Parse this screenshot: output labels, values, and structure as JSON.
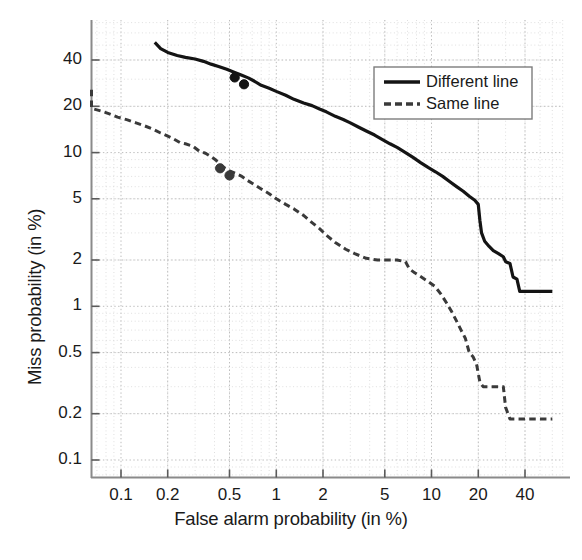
{
  "chart_data": {
    "type": "line",
    "title": "",
    "xlabel": "False alarm probability (in %)",
    "ylabel": "Miss probability (in %)",
    "xscale": "log-normal-deviate",
    "yscale": "log-normal-deviate",
    "grid": true,
    "xticks": [
      0.1,
      0.2,
      0.5,
      1,
      2,
      5,
      10,
      20,
      40
    ],
    "xticklabels": [
      "0.1",
      "0.2",
      "0.5",
      "1",
      "2",
      "5",
      "10",
      "20",
      "40"
    ],
    "yticks": [
      0.1,
      0.2,
      0.5,
      1,
      2,
      5,
      10,
      20,
      40
    ],
    "yticklabels": [
      "0.1",
      "0.2",
      "0.5",
      "1",
      "2",
      "5",
      "10",
      "20",
      "40"
    ],
    "xlim": [
      0.055,
      62
    ],
    "ylim": [
      0.075,
      52
    ],
    "legend_position": "top-right",
    "series": [
      {
        "name": "Different line",
        "style": "solid",
        "color": "#141414",
        "linewidth": 3.2,
        "points": [
          [
            0.165,
            52.0
          ],
          [
            0.18,
            47.5
          ],
          [
            0.2,
            44.8
          ],
          [
            0.23,
            42.8
          ],
          [
            0.26,
            41.6
          ],
          [
            0.3,
            40.6
          ],
          [
            0.34,
            39.2
          ],
          [
            0.38,
            37.6
          ],
          [
            0.43,
            36.2
          ],
          [
            0.48,
            34.8
          ],
          [
            0.53,
            33.4
          ],
          [
            0.6,
            31.8
          ],
          [
            0.66,
            30.6
          ],
          [
            0.72,
            29.2
          ],
          [
            0.8,
            27.4
          ],
          [
            0.9,
            26.2
          ],
          [
            1.0,
            25.0
          ],
          [
            1.15,
            23.6
          ],
          [
            1.3,
            22.2
          ],
          [
            1.5,
            21.0
          ],
          [
            1.7,
            20.2
          ],
          [
            1.9,
            19.2
          ],
          [
            2.1,
            18.4
          ],
          [
            2.4,
            17.2
          ],
          [
            2.7,
            16.4
          ],
          [
            3.0,
            15.6
          ],
          [
            3.4,
            14.6
          ],
          [
            3.8,
            13.8
          ],
          [
            4.3,
            13.0
          ],
          [
            4.8,
            12.2
          ],
          [
            5.4,
            11.4
          ],
          [
            6.0,
            10.8
          ],
          [
            6.8,
            10.0
          ],
          [
            7.6,
            9.3
          ],
          [
            8.5,
            8.6
          ],
          [
            9.5,
            8.0
          ],
          [
            10.6,
            7.5
          ],
          [
            11.8,
            7.0
          ],
          [
            13.0,
            6.5
          ],
          [
            14.5,
            6.0
          ],
          [
            16.0,
            5.6
          ],
          [
            17.5,
            5.2
          ],
          [
            19.0,
            4.9
          ],
          [
            20.0,
            4.6
          ],
          [
            20.5,
            3.6
          ],
          [
            21.0,
            3.0
          ],
          [
            22.0,
            2.65
          ],
          [
            23.5,
            2.45
          ],
          [
            25.0,
            2.3
          ],
          [
            27.0,
            2.2
          ],
          [
            29.0,
            2.1
          ],
          [
            30.0,
            1.95
          ],
          [
            32.0,
            1.9
          ],
          [
            33.5,
            1.55
          ],
          [
            35.5,
            1.5
          ],
          [
            37.0,
            1.25
          ],
          [
            42.0,
            1.25
          ],
          [
            48.0,
            1.25
          ],
          [
            56.0,
            1.25
          ],
          [
            60.0,
            1.25
          ]
        ],
        "markers": [
          [
            0.54,
            30.8
          ],
          [
            0.62,
            27.8
          ]
        ]
      },
      {
        "name": "Same line",
        "style": "dashed",
        "color": "#3a3a3a",
        "linewidth": 3.0,
        "points": [
          [
            0.062,
            25.6
          ],
          [
            0.062,
            22.0
          ],
          [
            0.064,
            19.4
          ],
          [
            0.075,
            18.6
          ],
          [
            0.085,
            17.8
          ],
          [
            0.095,
            17.0
          ],
          [
            0.11,
            16.3
          ],
          [
            0.125,
            15.6
          ],
          [
            0.14,
            15.0
          ],
          [
            0.16,
            14.2
          ],
          [
            0.18,
            13.4
          ],
          [
            0.2,
            12.8
          ],
          [
            0.22,
            12.2
          ],
          [
            0.24,
            11.6
          ],
          [
            0.26,
            11.4
          ],
          [
            0.29,
            11.0
          ],
          [
            0.32,
            10.2
          ],
          [
            0.35,
            9.9
          ],
          [
            0.38,
            9.4
          ],
          [
            0.41,
            8.9
          ],
          [
            0.44,
            8.2
          ],
          [
            0.47,
            7.9
          ],
          [
            0.5,
            7.6
          ],
          [
            0.55,
            7.3
          ],
          [
            0.6,
            7.0
          ],
          [
            0.65,
            6.6
          ],
          [
            0.72,
            6.2
          ],
          [
            0.8,
            5.8
          ],
          [
            0.9,
            5.4
          ],
          [
            1.0,
            5.0
          ],
          [
            1.15,
            4.6
          ],
          [
            1.3,
            4.3
          ],
          [
            1.5,
            3.9
          ],
          [
            1.7,
            3.5
          ],
          [
            1.9,
            3.2
          ],
          [
            2.1,
            2.9
          ],
          [
            2.4,
            2.6
          ],
          [
            2.8,
            2.35
          ],
          [
            3.2,
            2.2
          ],
          [
            3.8,
            2.05
          ],
          [
            4.5,
            2.0
          ],
          [
            5.2,
            2.0
          ],
          [
            6.0,
            2.0
          ],
          [
            6.8,
            1.95
          ],
          [
            7.2,
            1.75
          ],
          [
            7.8,
            1.65
          ],
          [
            8.6,
            1.55
          ],
          [
            9.5,
            1.45
          ],
          [
            10.5,
            1.35
          ],
          [
            11.5,
            1.2
          ],
          [
            12.5,
            1.05
          ],
          [
            13.5,
            0.92
          ],
          [
            14.5,
            0.8
          ],
          [
            15.5,
            0.7
          ],
          [
            16.5,
            0.62
          ],
          [
            17.5,
            0.5
          ],
          [
            18.5,
            0.47
          ],
          [
            19.5,
            0.42
          ],
          [
            20.5,
            0.32
          ],
          [
            21.5,
            0.3
          ],
          [
            23.0,
            0.3
          ],
          [
            25.0,
            0.3
          ],
          [
            27.0,
            0.3
          ],
          [
            29.0,
            0.3
          ],
          [
            30.0,
            0.22
          ],
          [
            32.0,
            0.185
          ],
          [
            36.0,
            0.185
          ],
          [
            42.0,
            0.185
          ],
          [
            50.0,
            0.185
          ],
          [
            60.0,
            0.185
          ]
        ],
        "markers": [
          [
            0.435,
            7.9
          ],
          [
            0.5,
            7.1
          ]
        ]
      }
    ],
    "legend": [
      {
        "label": "Different line",
        "style": "solid"
      },
      {
        "label": "Same line",
        "style": "dashed"
      }
    ]
  },
  "legend": {
    "items": [
      {
        "label": "Different line"
      },
      {
        "label": "Same line"
      }
    ]
  },
  "axes": {
    "xlabel": "False alarm probability (in %)",
    "ylabel": "Miss probability (in %)"
  }
}
